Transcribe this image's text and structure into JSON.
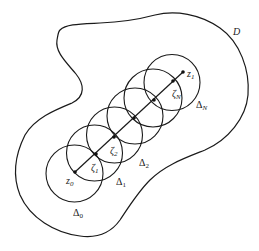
{
  "figure": {
    "domain_label": "D",
    "start_point": {
      "label": "z",
      "sub": "0",
      "x": 75,
      "y": 172
    },
    "end_point": {
      "label": "z",
      "sub": "1",
      "x": 183,
      "y": 72
    },
    "intermediate_points": [
      {
        "label": "ζ",
        "sub": "1",
        "x": 96,
        "y": 154
      },
      {
        "label": "ζ",
        "sub": "2",
        "x": 114,
        "y": 137
      },
      {
        "label": "",
        "sub": "",
        "x": 134,
        "y": 118
      },
      {
        "label": "",
        "sub": "",
        "x": 154,
        "y": 100
      },
      {
        "label": "ζ",
        "sub": "N",
        "x": 173,
        "y": 81
      }
    ],
    "disks": [
      {
        "label": "Δ",
        "sub": "0",
        "cx": 74.5,
        "cy": 173.5,
        "r": 28.5
      },
      {
        "label": "Δ",
        "sub": "1",
        "cx": 94.5,
        "cy": 153,
        "r": 28
      },
      {
        "label": "Δ",
        "sub": "2",
        "cx": 114.5,
        "cy": 135,
        "r": 28
      },
      {
        "label": "",
        "sub": "",
        "cx": 135,
        "cy": 116,
        "r": 28
      },
      {
        "label": "",
        "sub": "",
        "cx": 153,
        "cy": 98,
        "r": 29
      },
      {
        "label": "Δ",
        "sub": "N",
        "cx": 172,
        "cy": 82.5,
        "r": 28
      }
    ],
    "labels": {
      "D": "D",
      "z0": "z",
      "z0_sub": "0",
      "z1": "z",
      "z1_sub": "1",
      "zeta1": "ζ",
      "zeta1_sub": "1",
      "zeta2": "ζ",
      "zeta2_sub": "2",
      "zetaN": "ζ",
      "zetaN_sub": "N",
      "delta0": "Δ",
      "delta0_sub": "0",
      "delta1": "Δ",
      "delta1_sub": "1",
      "delta2": "Δ",
      "delta2_sub": "2",
      "deltaN": "Δ",
      "deltaN_sub": "N"
    },
    "colors": {
      "stroke": "#1a1a1a",
      "background": "#ffffff"
    }
  }
}
